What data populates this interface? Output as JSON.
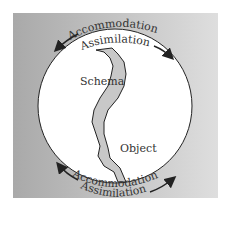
{
  "diagram": {
    "top": {
      "line1": "Accommodation",
      "line2": "Assimilation"
    },
    "bottom": {
      "line1": "Accommodation",
      "line2": "Assimilation"
    },
    "region_left": "Schema",
    "region_right": "Object",
    "colors": {
      "panel_dark": "#a9a9a9",
      "panel_light": "#dcdcdc",
      "circle": "#ffffff",
      "gap": "#c4c4c4",
      "stroke": "#222222"
    }
  }
}
